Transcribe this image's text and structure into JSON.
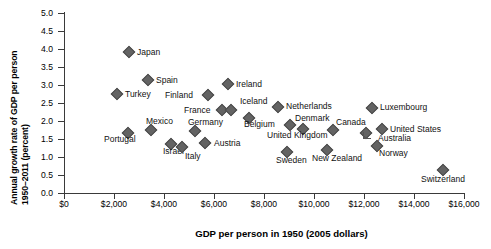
{
  "chart_data": {
    "type": "scatter",
    "title": "",
    "xlabel": "GDP per person in 1950 (2005 dollars)",
    "ylabel_line1": "Annual growth rate of GDP per person",
    "ylabel_line2": "1950–2011 (percent)",
    "xlim": [
      0,
      16000
    ],
    "ylim": [
      0.0,
      5.0
    ],
    "grid": false,
    "legend": "none",
    "xticks": [
      "$0",
      "$2,000",
      "$4,000",
      "$6,000",
      "$8,000",
      "$10,000",
      "$12,000",
      "$14,000",
      "$16,000"
    ],
    "xtick_values": [
      0,
      2000,
      4000,
      6000,
      8000,
      10000,
      12000,
      14000,
      16000
    ],
    "yticks": [
      "0.0",
      "0.5",
      "1.0",
      "1.5",
      "2.0",
      "2.5",
      "3.0",
      "3.5",
      "4.0",
      "4.5",
      "5.0"
    ],
    "ytick_values": [
      0.0,
      0.5,
      1.0,
      1.5,
      2.0,
      2.5,
      3.0,
      3.5,
      4.0,
      4.5,
      5.0
    ],
    "marker": "diamond",
    "marker_color": "#636363",
    "points": [
      {
        "label": "Japan",
        "x": 2600,
        "y": 3.92,
        "lx": 8,
        "ly": -4
      },
      {
        "label": "Spain",
        "x": 3360,
        "y": 3.14,
        "lx": 8,
        "ly": -4
      },
      {
        "label": "Turkey",
        "x": 2120,
        "y": 2.75,
        "lx": 8,
        "ly": -4
      },
      {
        "label": "Ireland",
        "x": 6560,
        "y": 3.03,
        "lx": 8,
        "ly": -4
      },
      {
        "label": "Finland",
        "x": 5760,
        "y": 2.72,
        "lx": -43,
        "ly": -4
      },
      {
        "label": "France",
        "x": 6320,
        "y": 2.31,
        "lx": -38,
        "ly": -4
      },
      {
        "label": "Iceland",
        "x": 6680,
        "y": 2.31,
        "lx": 9,
        "ly": -13
      },
      {
        "label": "Netherlands",
        "x": 8560,
        "y": 2.39,
        "lx": 8,
        "ly": -5
      },
      {
        "label": "Luxembourg",
        "x": 12320,
        "y": 2.36,
        "lx": 8,
        "ly": -5
      },
      {
        "label": "Belgium",
        "x": 7400,
        "y": 2.08,
        "lx": -5,
        "ly": 2
      },
      {
        "label": "Denmark",
        "x": 9040,
        "y": 1.89,
        "lx": 5,
        "ly": -11
      },
      {
        "label": "Canada",
        "x": 10760,
        "y": 1.75,
        "lx": 3,
        "ly": -12
      },
      {
        "label": "United States",
        "x": 12720,
        "y": 1.78,
        "lx": 8,
        "ly": -4
      },
      {
        "label": "Mexico",
        "x": 3480,
        "y": 1.75,
        "lx": -5,
        "ly": -13
      },
      {
        "label": "Germany",
        "x": 5240,
        "y": 1.72,
        "lx": -7,
        "ly": -13
      },
      {
        "label": "Austria",
        "x": 5640,
        "y": 1.39,
        "lx": 9,
        "ly": -4
      },
      {
        "label": "Portugal",
        "x": 2560,
        "y": 1.67,
        "lx": -24,
        "ly": 2
      },
      {
        "label": "Israel",
        "x": 4280,
        "y": 1.36,
        "lx": -8,
        "ly": 3
      },
      {
        "label": "Italy",
        "x": 4720,
        "y": 1.28,
        "lx": 3,
        "ly": 5
      },
      {
        "label": "United Kingdom",
        "x": 9560,
        "y": 1.78,
        "lx": -36,
        "ly": 2
      },
      {
        "label": "Sweden",
        "x": 8920,
        "y": 1.14,
        "lx": -11,
        "ly": 4
      },
      {
        "label": "New Zealand",
        "x": 10520,
        "y": 1.19,
        "lx": -15,
        "ly": 4
      },
      {
        "label": "Australia",
        "x": 12080,
        "y": 1.67,
        "lx": 12,
        "ly": 1
      },
      {
        "label": "Norway",
        "x": 12520,
        "y": 1.31,
        "lx": 2,
        "ly": 3
      },
      {
        "label": "Switzerland",
        "x": 15160,
        "y": 0.64,
        "lx": -22,
        "ly": 5
      }
    ]
  }
}
